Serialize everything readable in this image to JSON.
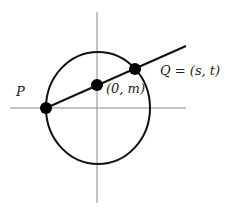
{
  "diagram": {
    "labels": {
      "p": "P",
      "center": "(0, m)",
      "q": "Q = (s, t)"
    },
    "colors": {
      "stroke": "#111111",
      "axis": "#888888",
      "background": "#ffffff"
    }
  }
}
